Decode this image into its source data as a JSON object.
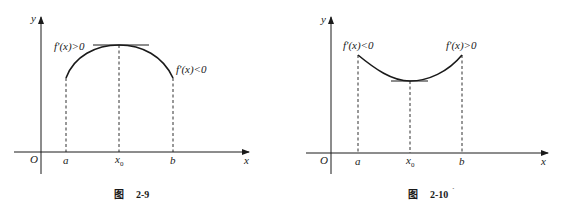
{
  "figures": [
    {
      "id": "fig-2-9",
      "caption_char": "图",
      "caption_num": "2-9",
      "axis_labels": {
        "origin": "O",
        "x": "x",
        "y": "y"
      },
      "ticks": {
        "a": "a",
        "x0_base": "x",
        "x0_sub": "0",
        "b": "b"
      },
      "left_label": "f'(x)>0",
      "right_label": "f'(x)<0",
      "shape": "concave-down (local maximum at x0)"
    },
    {
      "id": "fig-2-10",
      "caption_char": "图",
      "caption_num": "2-10",
      "caption_mark": "´",
      "axis_labels": {
        "origin": "O",
        "x": "x",
        "y": "y"
      },
      "ticks": {
        "a": "a",
        "x0_base": "x",
        "x0_sub": "0",
        "b": "b"
      },
      "left_label": "f'(x)<0",
      "right_label": "f'(x)>0",
      "shape": "concave-up (local minimum at x0)"
    }
  ]
}
